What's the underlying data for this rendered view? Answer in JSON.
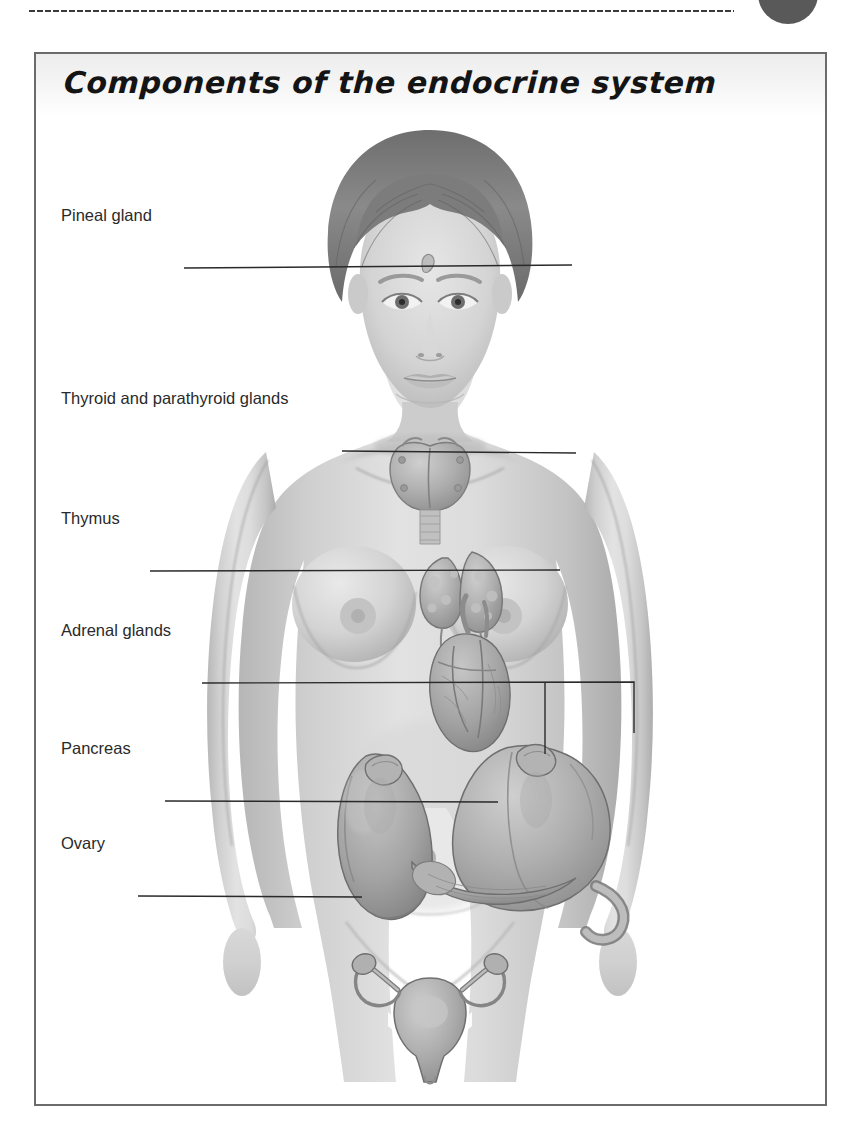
{
  "page": {
    "background_color": "#ffffff",
    "decor": {
      "dotted_rule": "dotted-rule",
      "corner_circle_color": "#595959"
    }
  },
  "figure": {
    "title": "Components of the endocrine system",
    "border_color": "#6b6b6b",
    "title_band_color": "#ededed",
    "illustration": {
      "name": "female-endocrine-system-illustration",
      "style": "grayscale pencil-rendered anatomical drawing",
      "subject": "anterior view of a female body showing endocrine organs",
      "skin_tone": "#c9c9c9",
      "organ_tone": "#a9a9a9"
    },
    "labels": [
      {
        "id": "pineal-gland",
        "text": "Pineal gland",
        "y": 215
      },
      {
        "id": "thyroid-and-parathyroid",
        "text": "Thyroid and parathyroid glands",
        "y": 398
      },
      {
        "id": "thymus",
        "text": "Thymus",
        "y": 518
      },
      {
        "id": "adrenal-glands",
        "text": "Adrenal glands",
        "y": 630
      },
      {
        "id": "pancreas",
        "text": "Pancreas",
        "y": 748
      },
      {
        "id": "ovary",
        "text": "Ovary",
        "y": 843
      }
    ],
    "leader_line_color": "#2a2a2a"
  }
}
